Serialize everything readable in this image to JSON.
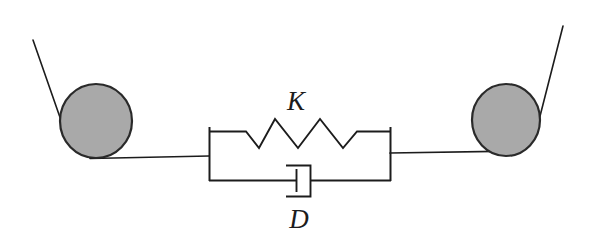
{
  "diagram": {
    "background_color": "#ffffff",
    "stroke_color": "#1c1c1c",
    "labels": {
      "spring": "K",
      "dashpot": "D"
    },
    "elements": {
      "left_roller": {
        "name": "left-roller",
        "fill_color": "#a9a9a9",
        "stroke_color": "#2a2a2a",
        "cx": 96,
        "cy": 121,
        "rx": 36,
        "ry": 37
      },
      "right_roller": {
        "name": "right-roller",
        "fill_color": "#a9a9a9",
        "stroke_color": "#2a2a2a",
        "cx": 506,
        "cy": 120,
        "rx": 34,
        "ry": 36
      },
      "left_belt_diagonal": {
        "name": "left-belt-diagonal",
        "x1": 33,
        "y1": 40,
        "x2": 63,
        "y2": 126
      },
      "right_belt_diagonal": {
        "name": "right-belt-diagonal",
        "x1": 563,
        "y1": 26,
        "x2": 538,
        "y2": 124
      },
      "left_belt_horizontal": {
        "name": "left-belt-horizontal",
        "x1": 90,
        "y1": 158,
        "x2": 209,
        "y2": 156
      },
      "right_belt_horizontal": {
        "name": "right-belt-horizontal",
        "x1": 390,
        "y1": 153,
        "x2": 520,
        "y2": 151
      },
      "left_terminal_bar": {
        "name": "left-terminal-bar",
        "x": 209,
        "y1": 128,
        "y2": 181
      },
      "right_terminal_bar": {
        "name": "right-terminal-bar",
        "x": 390,
        "y1": 128,
        "y2": 181
      },
      "spring_branch": {
        "name": "spring-branch",
        "lead_y": 131,
        "lead_left_x": [
          209,
          245
        ],
        "lead_right_x": [
          365,
          390
        ],
        "peak_y": 120,
        "valley_y": 148,
        "coil_count": 3,
        "zigzag_points": "209,131 245,131 259,148 275,120 298,148 320,120 343,148 358,131 390,131"
      },
      "dashpot_branch": {
        "name": "dashpot-branch",
        "rail_y": 180,
        "rod_left_x": [
          209,
          296
        ],
        "rod_right_x": [
          311,
          390
        ],
        "cylinder": {
          "x": 287,
          "y": 165,
          "w": 24,
          "h": 32
        },
        "piston": {
          "x": 296,
          "y1": 170,
          "y2": 192
        }
      },
      "spring_label_pos": {
        "x": 296,
        "y": 110
      },
      "dashpot_label_pos": {
        "x": 299,
        "y": 228
      }
    }
  }
}
